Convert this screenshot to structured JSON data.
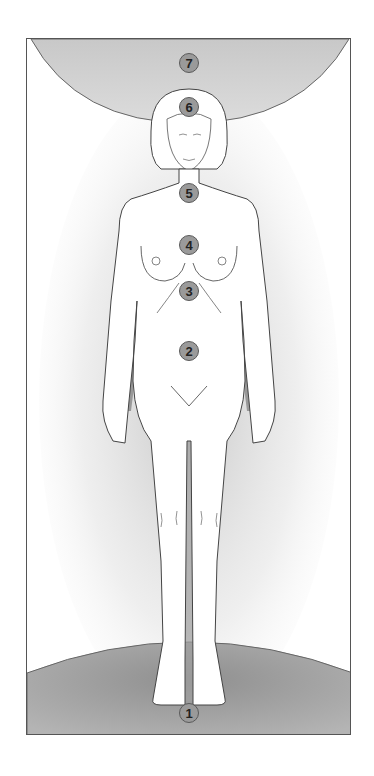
{
  "figure": {
    "colors": {
      "background": "#ffffff",
      "frame_border": "#555555",
      "sphere_fill": "#a8a8a8",
      "marker_fill": "#9a9a9a",
      "marker_border": "#5a5a5a",
      "body_outline": "#444444",
      "body_fill": "#ffffff"
    },
    "markers": [
      {
        "label": "7",
        "x": 188,
        "y": 62
      },
      {
        "label": "6",
        "x": 188,
        "y": 106
      },
      {
        "label": "5",
        "x": 188,
        "y": 192
      },
      {
        "label": "4",
        "x": 188,
        "y": 244
      },
      {
        "label": "3",
        "x": 188,
        "y": 290
      },
      {
        "label": "2",
        "x": 188,
        "y": 350
      },
      {
        "label": "1",
        "x": 188,
        "y": 712
      }
    ]
  }
}
